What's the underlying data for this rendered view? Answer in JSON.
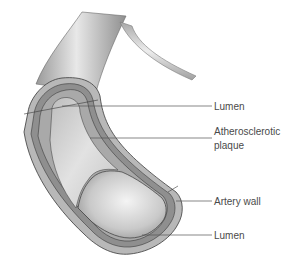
{
  "diagram": {
    "labels": [
      {
        "id": "lumen-top",
        "text": "Lumen"
      },
      {
        "id": "plaque",
        "text": "Atherosclerotic",
        "text2": "plaque"
      },
      {
        "id": "artery-wall",
        "text": "Artery wall"
      },
      {
        "id": "lumen-bottom",
        "text": "Lumen"
      }
    ],
    "colors": {
      "outer_wall": "#b5b5b5",
      "wall_band": "#8e8e8e",
      "plaque": "#cfcfcf",
      "lumen": "#e4e4e4",
      "outline": "#3a3a3a",
      "leader": "#555555"
    }
  }
}
